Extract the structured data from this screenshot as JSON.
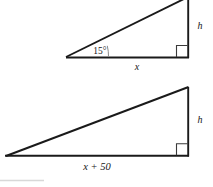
{
  "figure": {
    "background_color": "#ffffff",
    "line_color": "#1a1a1a",
    "label_color": "#161616",
    "arc_color": "#8a8a8a",
    "right_angle_color": "#3a3a3a",
    "faint_rule_color": "#d8d8d8",
    "triangles": [
      {
        "id": "top-triangle",
        "name": "small-right-triangle",
        "angle_label": "15°",
        "base_label": "x",
        "height_label": "h",
        "right_angle": true,
        "vertices": {
          "left": [
            66,
            57
          ],
          "right": [
            188,
            57
          ],
          "apex": [
            188,
            -2
          ]
        }
      },
      {
        "id": "bottom-triangle",
        "name": "large-right-triangle",
        "angle_label": "",
        "base_label": "x + 50",
        "height_label": "h",
        "right_angle": true,
        "vertices": {
          "left": [
            6,
            156
          ],
          "right": [
            188,
            156
          ],
          "apex": [
            188,
            88
          ]
        }
      }
    ],
    "labels": {
      "top_angle": "15°",
      "top_base": "x",
      "top_height": "h",
      "bottom_base": "x + 50",
      "bottom_height": "h"
    }
  }
}
